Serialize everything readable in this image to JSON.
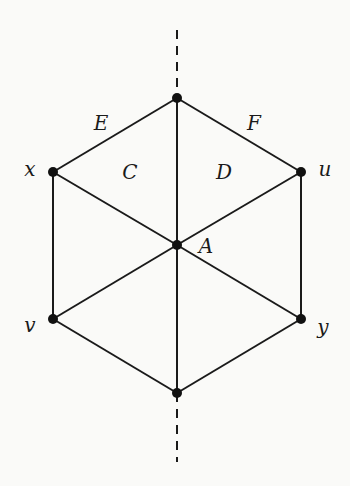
{
  "diagram": {
    "title": "",
    "vertices": [
      {
        "id": "top",
        "label": "",
        "x": 177,
        "y": 98
      },
      {
        "id": "x",
        "label": "x",
        "x": 53,
        "y": 172
      },
      {
        "id": "u",
        "label": "u",
        "x": 301,
        "y": 172
      },
      {
        "id": "A",
        "label": "A",
        "x": 177,
        "y": 245
      },
      {
        "id": "v",
        "label": "v",
        "x": 53,
        "y": 319
      },
      {
        "id": "y",
        "label": "y",
        "x": 301,
        "y": 319
      },
      {
        "id": "bottom",
        "label": "",
        "x": 177,
        "y": 393
      }
    ],
    "edges": [
      [
        "top",
        "x"
      ],
      [
        "top",
        "u"
      ],
      [
        "top",
        "A"
      ],
      [
        "x",
        "A"
      ],
      [
        "u",
        "A"
      ],
      [
        "x",
        "v"
      ],
      [
        "u",
        "y"
      ],
      [
        "v",
        "A"
      ],
      [
        "y",
        "A"
      ],
      [
        "v",
        "bottom"
      ],
      [
        "y",
        "bottom"
      ],
      [
        "A",
        "bottom"
      ]
    ],
    "dashed_axis": {
      "top_segment": {
        "x": 177,
        "y1": 30,
        "y2": 98
      },
      "bottom_segment": {
        "x": 177,
        "y1": 393,
        "y2": 462
      }
    },
    "labels": {
      "vertex_x": "x",
      "vertex_u": "u",
      "vertex_A": "A",
      "vertex_v": "v",
      "vertex_y": "y",
      "edge_E": "E",
      "edge_F": "F",
      "face_C": "C",
      "face_D": "D"
    },
    "colors": {
      "line": "#1a1a1a",
      "vertex": "#111111",
      "background": "#fafaf8"
    }
  }
}
